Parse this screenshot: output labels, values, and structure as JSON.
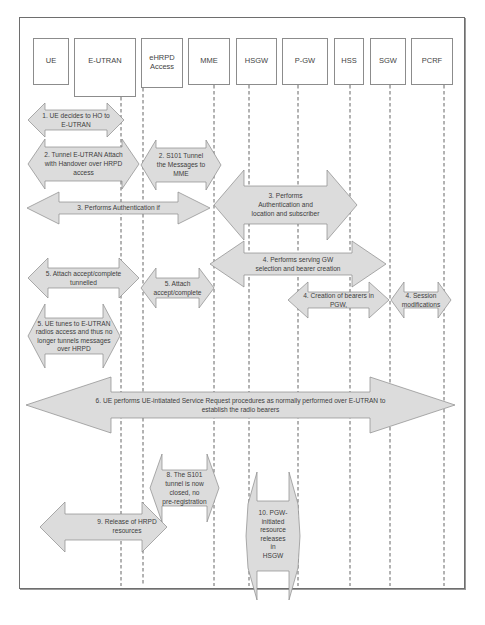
{
  "diagram": {
    "type": "sequence-diagram",
    "entities": [
      {
        "id": "ue",
        "label": [
          "UE"
        ]
      },
      {
        "id": "e-utran",
        "label": [
          "E-UTRAN"
        ]
      },
      {
        "id": "ehrpd",
        "label": [
          "eHRPD",
          "Access"
        ]
      },
      {
        "id": "mme",
        "label": [
          "MME"
        ]
      },
      {
        "id": "hsgw",
        "label": [
          "HSGW"
        ]
      },
      {
        "id": "p-gw",
        "label": [
          "P-GW"
        ]
      },
      {
        "id": "hss",
        "label": [
          "HSS"
        ]
      },
      {
        "id": "sgw",
        "label": [
          "SGW"
        ]
      },
      {
        "id": "pcrf",
        "label": [
          "PCRF"
        ]
      }
    ],
    "steps": [
      {
        "id": "step-1",
        "lines": [
          "1. UE decides to HO to",
          "E-UTRAN"
        ]
      },
      {
        "id": "step-2a",
        "lines": [
          "2. Tunnel E-UTRAN Attach",
          "with Handover over HRPD",
          "access"
        ]
      },
      {
        "id": "step-2b",
        "lines": [
          "2. S101 Tunnel",
          "the Messages to",
          "MME"
        ]
      },
      {
        "id": "step-3a",
        "lines": [
          "3. Performs Authentication if"
        ]
      },
      {
        "id": "step-3b",
        "lines": [
          "3. Performs",
          "Authentication and",
          "location and subscriber"
        ]
      },
      {
        "id": "step-4a",
        "lines": [
          "4. Performs serving GW",
          "selection and bearer creation"
        ]
      },
      {
        "id": "step-4b",
        "lines": [
          "4. Creation of bearers in",
          "PGW,"
        ]
      },
      {
        "id": "step-4c",
        "lines": [
          "4. Session",
          "modifications"
        ]
      },
      {
        "id": "step-5a",
        "lines": [
          "5. Attach accept/complete",
          "tunnelled"
        ]
      },
      {
        "id": "step-5b",
        "lines": [
          "5. Attach",
          "accept/complete"
        ]
      },
      {
        "id": "step-5c",
        "lines": [
          "5. UE tunes to E-UTRAN",
          "radios access and thus no",
          "longer tunnels messages",
          "over HRPD"
        ]
      },
      {
        "id": "step-6",
        "lines": [
          "6. UE performs UE-intiatated Service Request procedures as normally performed over E-UTRAN to",
          "establish the radio bearers"
        ]
      },
      {
        "id": "step-8",
        "lines": [
          "8. The S101",
          "tunnel is now",
          "closed, no",
          "pre-registration"
        ]
      },
      {
        "id": "step-9",
        "lines": [
          "9. Release of HRPD",
          "resources"
        ]
      },
      {
        "id": "step-10",
        "lines": [
          "10. PGW-",
          "initiated",
          "resource",
          "releases",
          "in",
          "HSGW"
        ]
      }
    ]
  },
  "colors": {
    "arrow_fill": "#dcdcdc",
    "arrow_stroke": "#8a8a8a",
    "frame": "#6e6e6e",
    "text": "#3c3c3c"
  }
}
